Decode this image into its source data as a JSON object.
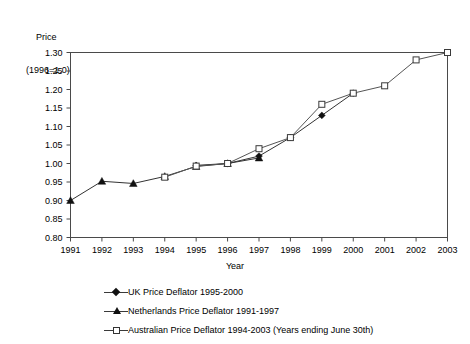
{
  "chart_data": {
    "type": "line",
    "title": "",
    "ylabel_line1": "Price",
    "ylabel_line2": "(1996=1.0)",
    "xlabel": "Year",
    "x": [
      1991,
      1992,
      1993,
      1994,
      1995,
      1996,
      1997,
      1998,
      1999,
      2000,
      2001,
      2002,
      2003
    ],
    "xticklabels": [
      "1991",
      "1992",
      "1993",
      "1994",
      "1995",
      "1996",
      "1997",
      "1998",
      "1999",
      "2000",
      "2001",
      "2002",
      "2003"
    ],
    "yticklabels": [
      "0.80",
      "0.85",
      "0.90",
      "0.95",
      "1.00",
      "1.05",
      "1.10",
      "1.15",
      "1.20",
      "1.25",
      "1.30"
    ],
    "yticks": [
      0.8,
      0.85,
      0.9,
      0.95,
      1.0,
      1.05,
      1.1,
      1.15,
      1.2,
      1.25,
      1.3
    ],
    "ylim": [
      0.8,
      1.3
    ],
    "xlim": [
      1991,
      2003
    ],
    "grid": false,
    "legend_position": "below",
    "series": [
      {
        "name": "UK Price Deflator 1995-2000",
        "marker": "diamond-filled",
        "color": "#333333",
        "points": [
          {
            "x": 1995,
            "y": 0.995
          },
          {
            "x": 1996,
            "y": 1.0
          },
          {
            "x": 1997,
            "y": 1.02
          },
          {
            "x": 1998,
            "y": 1.07
          },
          {
            "x": 1999,
            "y": 1.13
          },
          {
            "x": 2000,
            "y": 1.19
          }
        ]
      },
      {
        "name": "Netherlands Price Deflator 1991-1997",
        "marker": "triangle-filled",
        "color": "#333333",
        "points": [
          {
            "x": 1991,
            "y": 0.9
          },
          {
            "x": 1992,
            "y": 0.952
          },
          {
            "x": 1993,
            "y": 0.946
          },
          {
            "x": 1994,
            "y": 0.965
          },
          {
            "x": 1995,
            "y": 0.992
          },
          {
            "x": 1996,
            "y": 1.0
          },
          {
            "x": 1997,
            "y": 1.015
          }
        ]
      },
      {
        "name": "Australian Price Deflator 1994-2003 (Years ending June 30th)",
        "marker": "square-open",
        "color": "#555555",
        "points": [
          {
            "x": 1994,
            "y": 0.963
          },
          {
            "x": 1995,
            "y": 0.993
          },
          {
            "x": 1996,
            "y": 1.0
          },
          {
            "x": 1997,
            "y": 1.04
          },
          {
            "x": 1998,
            "y": 1.07
          },
          {
            "x": 1999,
            "y": 1.16
          },
          {
            "x": 2000,
            "y": 1.19
          },
          {
            "x": 2001,
            "y": 1.21
          },
          {
            "x": 2002,
            "y": 1.28
          },
          {
            "x": 2003,
            "y": 1.3
          }
        ]
      }
    ]
  },
  "legend": {
    "items": [
      {
        "label": "UK Price Deflator 1995-2000",
        "marker": "diamond-filled"
      },
      {
        "label": "Netherlands Price Deflator 1991-1997",
        "marker": "triangle-filled"
      },
      {
        "label": "Australian Price Deflator 1994-2003 (Years ending June 30th)",
        "marker": "square-open"
      }
    ]
  }
}
